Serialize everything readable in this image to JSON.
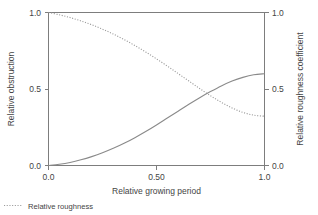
{
  "chart_data": {
    "type": "line",
    "title": "",
    "xlabel": "Relative growing period",
    "ylabel": "Relative obstruction",
    "y2label": "Relative roughness coefficient",
    "xlim": [
      0.0,
      1.0
    ],
    "ylim": [
      0.0,
      1.0
    ],
    "y2lim": [
      0.0,
      1.0
    ],
    "grid": false,
    "legend_position": "bottom-left",
    "xticks": [
      "0.0",
      "0.50",
      "1.0"
    ],
    "xtick_values": [
      0.0,
      0.5,
      1.0
    ],
    "yticks": [
      "0.0",
      "0.5",
      "1.0"
    ],
    "ytick_values": [
      0.0,
      0.5,
      1.0
    ],
    "y2ticks": [
      "0.0",
      "0.5",
      "1.0"
    ],
    "y2tick_values": [
      0.0,
      0.5,
      1.0
    ],
    "x": [
      0.0,
      0.05,
      0.1,
      0.15,
      0.2,
      0.25,
      0.3,
      0.35,
      0.4,
      0.45,
      0.5,
      0.55,
      0.6,
      0.65,
      0.7,
      0.75,
      0.8,
      0.85,
      0.9,
      0.95,
      1.0
    ],
    "series": [
      {
        "name": "Relative obstruction",
        "axis": "left",
        "style": "solid",
        "color": "#8a8a8a",
        "values": [
          0.0,
          0.008,
          0.02,
          0.037,
          0.058,
          0.083,
          0.112,
          0.145,
          0.182,
          0.222,
          0.265,
          0.31,
          0.355,
          0.4,
          0.443,
          0.483,
          0.52,
          0.552,
          0.576,
          0.593,
          0.6
        ]
      },
      {
        "name": "Relative roughness",
        "axis": "right",
        "style": "dotted",
        "color": "#9a9a9a",
        "values": [
          1.0,
          0.985,
          0.967,
          0.945,
          0.92,
          0.891,
          0.859,
          0.823,
          0.784,
          0.742,
          0.697,
          0.65,
          0.601,
          0.552,
          0.503,
          0.456,
          0.413,
          0.376,
          0.347,
          0.329,
          0.322
        ]
      }
    ],
    "annotations": {
      "crossover_x": 0.66,
      "crossover_y": 0.43
    }
  },
  "legend": {
    "entries": [
      {
        "label": "Relative roughness",
        "style": "dotted"
      }
    ]
  },
  "icons": {
    "legend_marker": "dotted-line-icon"
  }
}
